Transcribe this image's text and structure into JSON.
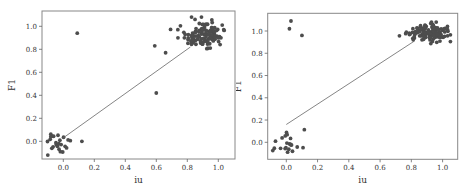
{
  "chart_data": [
    {
      "type": "scatter",
      "title": "",
      "xlabel": "iu",
      "ylabel": "F1",
      "xlim": [
        -0.14,
        1.1
      ],
      "ylim": [
        -0.13,
        1.14
      ],
      "xticks": [
        "0.0",
        "0.2",
        "0.4",
        "0.6",
        "0.8",
        "1.0"
      ],
      "yticks": [
        "0.0",
        "0.2",
        "0.4",
        "0.6",
        "0.8",
        "1.0"
      ],
      "grid": false,
      "legend": null,
      "marker_color": "#4d4d4d",
      "fit_line": {
        "x": [
          0.0,
          0.82
        ],
        "y": [
          0.03,
          0.82
        ],
        "color": "#666666"
      },
      "outliers": [
        {
          "x": 0.09,
          "y": 0.94
        },
        {
          "x": 0.59,
          "y": 0.83
        },
        {
          "x": 0.6,
          "y": 0.42
        },
        {
          "x": 0.66,
          "y": 0.77
        },
        {
          "x": 0.12,
          "y": 0.0
        }
      ],
      "clusters": [
        {
          "name": "low",
          "center_x": -0.01,
          "center_y": -0.02,
          "spread_x": 0.05,
          "spread_y": 0.05,
          "count": 24
        },
        {
          "name": "high",
          "center_x": 0.91,
          "center_y": 0.93,
          "spread_x": 0.07,
          "spread_y": 0.06,
          "count": 120
        }
      ]
    },
    {
      "type": "scatter",
      "title": "",
      "xlabel": "iu",
      "ylabel": "F1",
      "xlim": [
        -0.09,
        1.08
      ],
      "ylim": [
        -0.15,
        1.15
      ],
      "xticks": [
        "0.0",
        "0.2",
        "0.4",
        "0.6",
        "0.8",
        "1.0"
      ],
      "yticks": [
        "0.0",
        "0.2",
        "0.4",
        "0.6",
        "0.8",
        "1.0"
      ],
      "grid": false,
      "legend": null,
      "marker_color": "#4d4d4d",
      "fit_line": {
        "x": [
          0.0,
          0.82
        ],
        "y": [
          0.16,
          0.91
        ],
        "color": "#666666"
      },
      "outliers": [
        {
          "x": 0.03,
          "y": 1.09
        },
        {
          "x": 0.02,
          "y": 1.02
        },
        {
          "x": 0.1,
          "y": 0.96
        }
      ],
      "clusters": [
        {
          "name": "low",
          "center_x": 0.0,
          "center_y": 0.0,
          "spread_x": 0.04,
          "spread_y": 0.06,
          "count": 22
        },
        {
          "name": "high",
          "center_x": 0.91,
          "center_y": 0.98,
          "spread_x": 0.07,
          "spread_y": 0.04,
          "count": 120
        }
      ]
    }
  ]
}
